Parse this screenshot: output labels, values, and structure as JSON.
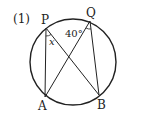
{
  "problem": {
    "number": "(1)"
  },
  "points": {
    "P": {
      "label": "P",
      "x": 46,
      "y": 28
    },
    "Q": {
      "label": "Q",
      "x": 90,
      "y": 21
    },
    "A": {
      "label": "A",
      "x": 45,
      "y": 97
    },
    "B": {
      "label": "B",
      "x": 99,
      "y": 95
    }
  },
  "circle": {
    "cx": 73,
    "cy": 62,
    "r": 43
  },
  "angles": {
    "at_P": {
      "label": "x"
    },
    "at_Q": {
      "label": "40°"
    }
  },
  "colors": {
    "stroke": "#222222"
  }
}
